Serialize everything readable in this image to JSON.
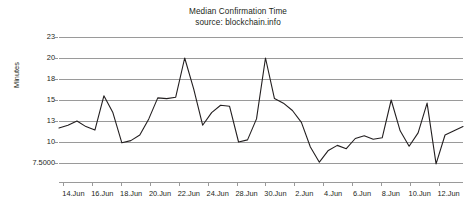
{
  "chart_data": {
    "type": "line",
    "title": "Median Confirmation Time",
    "subtitle": "source: blockchain.info",
    "xlabel": "",
    "ylabel": "Minutes",
    "grid": true,
    "legend": false,
    "y_tick_labels": [
      "23",
      "20",
      "18",
      "15",
      "13",
      "10",
      "7.5000"
    ],
    "y_tick_values": [
      23,
      20,
      18,
      15,
      13,
      10,
      7.5
    ],
    "y_axis_scale": "ordinal-evenly-spaced",
    "x_tick_labels": [
      "14.Jun",
      "16.Jun",
      "18.Jun",
      "20.Jun",
      "22.Jun",
      "24.Jun",
      "28.Jun",
      "30.Jun",
      "2.Jun",
      "4.Jun",
      "6.Jun",
      "8.Jun",
      "10.Jun",
      "12.Jun"
    ],
    "series": [
      {
        "name": "Median Confirmation Time",
        "color": "#231f20",
        "values": [
          12.0,
          12.4,
          13.0,
          12.2,
          11.7,
          15.6,
          13.8,
          9.9,
          10.2,
          11.0,
          13.2,
          15.3,
          15.2,
          15.4,
          20.0,
          16.6,
          12.4,
          13.8,
          14.5,
          14.4,
          10.0,
          10.3,
          13.2,
          20.0,
          15.2,
          14.7,
          14.0,
          12.8,
          9.4,
          7.6,
          9.0,
          9.6,
          9.2,
          10.5,
          10.9,
          10.4,
          10.6,
          15.0,
          11.6,
          9.5,
          11.3,
          14.7,
          7.4,
          11.0,
          11.6,
          12.2
        ]
      }
    ]
  }
}
